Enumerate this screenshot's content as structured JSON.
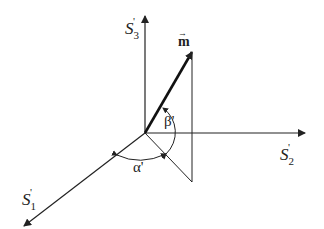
{
  "diagram": {
    "type": "3d-coordinate-system",
    "axes": [
      {
        "id": "s1",
        "label": "S",
        "subscript": "1",
        "prime": "'"
      },
      {
        "id": "s2",
        "label": "S",
        "subscript": "2",
        "prime": "'"
      },
      {
        "id": "s3",
        "label": "S",
        "subscript": "3",
        "prime": "'"
      }
    ],
    "vector": {
      "label": "m",
      "accent": "→"
    },
    "angles": [
      {
        "id": "alpha",
        "label": "α'"
      },
      {
        "id": "beta",
        "label": "β'"
      }
    ],
    "colors": {
      "line": "#222222",
      "background": "#ffffff"
    }
  }
}
